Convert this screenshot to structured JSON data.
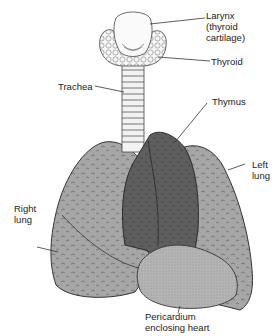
{
  "labels": {
    "larynx": "Larynx\n(thyroid\ncartilage)",
    "thyroid": "Thyroid",
    "trachea": "Trachea",
    "thymus": "Thymus",
    "left_lung": "Left\nlung",
    "right_lung": "Right\nlung",
    "pericardium": "Pericardium\nenclosing heart"
  },
  "colors": {
    "lung_fill": "#a6a6a6",
    "thymus_fill": "#5e5e5e",
    "pericardium_fill": "#b4b4b4",
    "outline": "#333333",
    "gland_fill": "#f4f4f4"
  }
}
